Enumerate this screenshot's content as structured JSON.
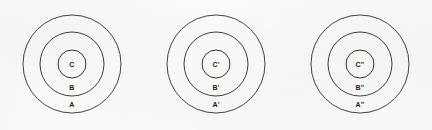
{
  "figure": {
    "width": 432,
    "height": 130,
    "background_color": "#fbfbfa",
    "stroke_color": "#3b3b3b",
    "label_color": "#1d1d1d"
  },
  "diagrams": [
    {
      "name": "diagram-1",
      "center_x": 72,
      "center_y": 64,
      "rings": [
        {
          "name": "outer",
          "label": "A",
          "radius": 49,
          "label_x": 72,
          "label_y": 104
        },
        {
          "name": "middle",
          "label": "B",
          "radius": 32,
          "label_x": 72,
          "label_y": 87
        },
        {
          "name": "inner",
          "label": "C",
          "radius": 14,
          "label_x": 72,
          "label_y": 64
        }
      ]
    },
    {
      "name": "diagram-2",
      "center_x": 216,
      "center_y": 64,
      "rings": [
        {
          "name": "outer",
          "label": "A'",
          "radius": 49,
          "label_x": 216,
          "label_y": 104
        },
        {
          "name": "middle",
          "label": "B'",
          "radius": 32,
          "label_x": 216,
          "label_y": 87
        },
        {
          "name": "inner",
          "label": "C'",
          "radius": 14,
          "label_x": 216,
          "label_y": 64
        }
      ]
    },
    {
      "name": "diagram-3",
      "center_x": 360,
      "center_y": 64,
      "rings": [
        {
          "name": "outer",
          "label": "A\"",
          "radius": 49,
          "label_x": 360,
          "label_y": 104
        },
        {
          "name": "middle",
          "label": "B\"",
          "radius": 32,
          "label_x": 360,
          "label_y": 87
        },
        {
          "name": "inner",
          "label": "C\"",
          "radius": 14,
          "label_x": 360,
          "label_y": 64
        }
      ]
    }
  ]
}
